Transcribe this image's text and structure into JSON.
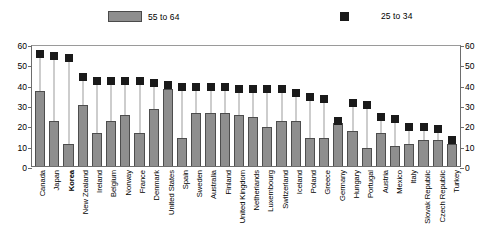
{
  "legend": {
    "bar_label": "55 to 64",
    "square_label": "25 to 34",
    "bar_color": "#8e8e8e",
    "square_color": "#1a1a1a"
  },
  "axis": {
    "ticks": [
      "0",
      "10",
      "20",
      "30",
      "40",
      "50",
      "60"
    ]
  },
  "chart_data": {
    "type": "bar",
    "title": "",
    "subtitle": "",
    "xlabel": "",
    "ylabel": "",
    "ylim": [
      0,
      60
    ],
    "ytick_values": [
      0,
      10,
      20,
      30,
      40,
      50,
      60
    ],
    "grid": false,
    "legend_position": "top",
    "dual_axis": true,
    "highlight_category": "Korea",
    "categories": [
      "Canada",
      "Japan",
      "Korea",
      "New Zealand",
      "Ireland",
      "Belgium",
      "Norway",
      "France",
      "Denmark",
      "United States",
      "Spain",
      "Sweden",
      "Australia",
      "Finland",
      "United Kingdom",
      "Netherlands",
      "Luxembourg",
      "Switzerland",
      "Iceland",
      "Poland",
      "Greece",
      "Germany",
      "Hungary",
      "Portugal",
      "Austria",
      "Mexico",
      "Italy",
      "Slovak Republic",
      "Czech Republic",
      "Turkey"
    ],
    "series": [
      {
        "name": "55 to 64",
        "type": "bar",
        "values": [
          37,
          22,
          11,
          30,
          16,
          22,
          25,
          16,
          28,
          38,
          14,
          26,
          26,
          26,
          25,
          24,
          19,
          22,
          22,
          14,
          14,
          21,
          17,
          9,
          16,
          10,
          11,
          13,
          13,
          11
        ]
      },
      {
        "name": "25 to 34",
        "type": "scatter",
        "values": [
          55,
          54,
          53,
          44,
          42,
          42,
          42,
          42,
          41,
          40,
          39,
          39,
          39,
          39,
          38,
          38,
          38,
          38,
          36,
          34,
          33,
          22,
          31,
          30,
          24,
          23,
          19,
          19,
          18,
          13
        ]
      }
    ]
  }
}
